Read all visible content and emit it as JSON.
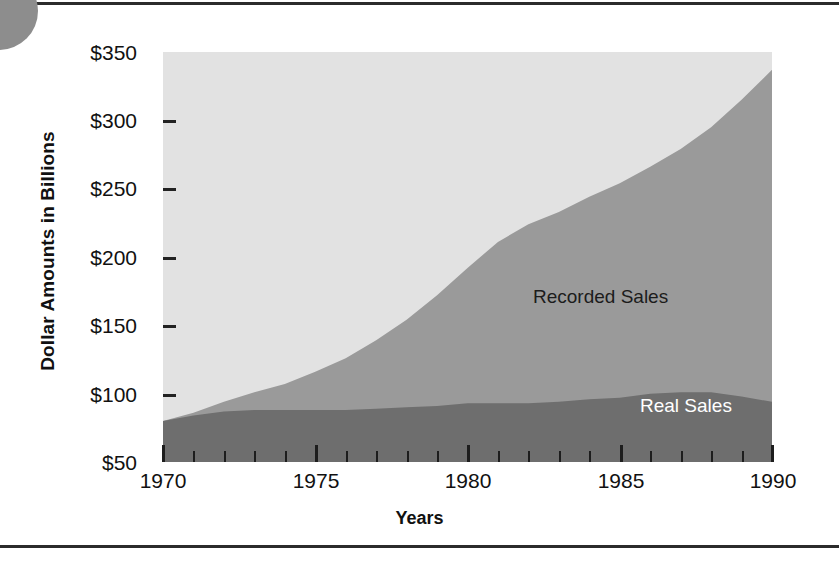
{
  "figure": {
    "y_axis_title": "Dollar Amounts in Billions",
    "x_axis_title": "Years"
  },
  "axes": {
    "y_ticks": [
      "$350",
      "$300",
      "$250",
      "$200",
      "$150",
      "$100",
      "$50"
    ],
    "x_ticks": [
      "1970",
      "1975",
      "1980",
      "1985",
      "1990"
    ]
  },
  "series_labels": {
    "recorded": "Recorded Sales",
    "real": "Real Sales"
  },
  "colors": {
    "plot_background": "#e2e2e2",
    "recorded_area": "#9a9a9a",
    "real_area": "#6e6e6e",
    "axis_text": "#111111",
    "rule": "#2b2b2b",
    "corner_disc": "#8d8d8d",
    "real_label_text": "#ffffff"
  },
  "chart_data": {
    "type": "area",
    "title": "",
    "xlabel": "Years",
    "ylabel": "Dollar Amounts in Billions",
    "xlim": [
      1970,
      1990
    ],
    "ylim": [
      50,
      350
    ],
    "grid": false,
    "legend": "in-plot annotations",
    "stacking": "overlaid (Real Sales drawn in front of Recorded Sales)",
    "x": [
      1970,
      1971,
      1972,
      1973,
      1974,
      1975,
      1976,
      1977,
      1978,
      1979,
      1980,
      1981,
      1982,
      1983,
      1984,
      1985,
      1986,
      1987,
      1988,
      1989,
      1990
    ],
    "series": [
      {
        "name": "Recorded Sales",
        "values": [
          80,
          86,
          94,
          101,
          107,
          116,
          126,
          139,
          154,
          172,
          192,
          211,
          224,
          233,
          244,
          254,
          266,
          279,
          295,
          315,
          337
        ]
      },
      {
        "name": "Real Sales",
        "values": [
          80,
          84,
          87,
          88,
          88,
          88,
          88,
          89,
          90,
          91,
          93,
          93,
          93,
          94,
          96,
          97,
          100,
          101,
          101,
          98,
          94
        ]
      }
    ],
    "x_tick_labels": [
      "1970",
      "1975",
      "1980",
      "1985",
      "1990"
    ],
    "x_minor_ticks": "every year",
    "y_tick_labels": [
      "$50",
      "$100",
      "$150",
      "$200",
      "$250",
      "$300",
      "$350"
    ]
  }
}
